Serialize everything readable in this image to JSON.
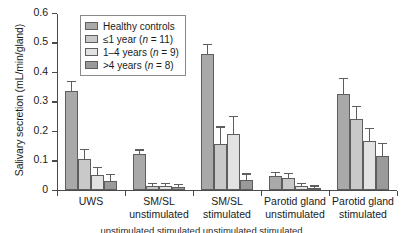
{
  "chart_data": {
    "type": "bar",
    "title": "",
    "xlabel": "",
    "ylabel": "Salivary secretion (mL/min/gland)",
    "ylim": [
      0,
      0.6
    ],
    "ytick_labels": [
      "0",
      "0.1",
      "0.2",
      "0.3",
      "0.4",
      "0.5",
      "0.6"
    ],
    "ytick_values": [
      0,
      0.1,
      0.2,
      0.3,
      0.4,
      0.5,
      0.6
    ],
    "grid": false,
    "legend_position": "top-left-inside",
    "categories": [
      "UWS",
      "SM/SL unstimulated",
      "SM/SL stimulated",
      "Parotid gland unstimulated",
      "Parotid gland stimulated"
    ],
    "category_lines": [
      [
        "UWS"
      ],
      [
        "SM/SL",
        "unstimulated"
      ],
      [
        "SM/SL",
        "stimulated"
      ],
      [
        "Parotid gland",
        "unstimulated"
      ],
      [
        "Parotid gland",
        "stimulated"
      ]
    ],
    "series": [
      {
        "name": "Healthy controls",
        "color": "#a9a9a9",
        "values": [
          0.335,
          0.12,
          0.46,
          0.045,
          0.325
        ],
        "errors": [
          0.03,
          0.012,
          0.03,
          0.012,
          0.05
        ]
      },
      {
        "name": "≤1 year (n = 11)",
        "color": "#c9c9c9",
        "values": [
          0.105,
          0.012,
          0.155,
          0.04,
          0.24
        ],
        "errors": [
          0.028,
          0.006,
          0.055,
          0.012,
          0.04
        ]
      },
      {
        "name": "1–4 years (n = 9)",
        "color": "#e2e2e2",
        "values": [
          0.05,
          0.013,
          0.19,
          0.012,
          0.165
        ],
        "errors": [
          0.022,
          0.006,
          0.055,
          0.008,
          0.04
        ]
      },
      {
        "name": ">4 years (n = 8)",
        "color": "#9a9a9a",
        "values": [
          0.03,
          0.01,
          0.033,
          0.006,
          0.115
        ],
        "errors": [
          0.02,
          0.005,
          0.018,
          0.004,
          0.038
        ]
      }
    ]
  },
  "legend": {
    "entries": [
      {
        "label": "Healthy controls",
        "label_plain": "Healthy controls"
      },
      {
        "label": "≤1 year (n = 11)",
        "label_plain": "≤1 year (n = 11)"
      },
      {
        "label": "1–4 years (n = 9)",
        "label_plain": "1–4 years (n = 9)"
      },
      {
        "label": ">4 years (n = 8)",
        "label_plain": ">4 years (n = 8)"
      }
    ]
  },
  "caption": {
    "text": "unstimulated        stimulated        unstimulated        stimulated"
  }
}
